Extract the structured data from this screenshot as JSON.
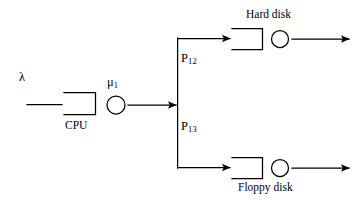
{
  "diagram": {
    "type": "queueing-network",
    "title": "",
    "canvas": {
      "width": 361,
      "height": 208,
      "background": "#ffffff"
    },
    "stroke_color": "#000000",
    "labels": {
      "arrival_rate": "λ",
      "cpu_service_rate": "μ",
      "cpu_service_rate_sub": "1",
      "cpu_station": "CPU",
      "branch_prob_hard": "P",
      "branch_prob_hard_sub": "12",
      "branch_prob_floppy": "P",
      "branch_prob_floppy_sub": "13",
      "hard_disk_station": "Hard disk",
      "floppy_disk_station": "Floppy disk"
    },
    "nodes": [
      {
        "id": "cpu",
        "name": "CPU",
        "queue_box": {
          "x": 64,
          "y": 92,
          "width": 32,
          "height": 23
        },
        "server_circle": {
          "cx": 116,
          "cy": 105,
          "r": 9
        }
      },
      {
        "id": "hard-disk",
        "name": "Hard disk",
        "queue_box": {
          "x": 232,
          "y": 28,
          "width": 31,
          "height": 22
        },
        "server_circle": {
          "cx": 280,
          "cy": 39,
          "r": 8.5
        }
      },
      {
        "id": "floppy-disk",
        "name": "Floppy disk",
        "queue_box": {
          "x": 232,
          "y": 157,
          "width": 31,
          "height": 22
        },
        "server_circle": {
          "cx": 280,
          "cy": 168,
          "r": 8.5
        }
      }
    ],
    "edges": [
      {
        "id": "arrival",
        "from": "external",
        "to": "cpu",
        "label": "λ",
        "arrowhead": false
      },
      {
        "id": "cpu-to-split",
        "from": "cpu",
        "to": "split-point",
        "arrowhead": true
      },
      {
        "id": "split-to-hard",
        "from": "split-point",
        "to": "hard-disk",
        "label": "P12",
        "arrowhead": true
      },
      {
        "id": "split-to-floppy",
        "from": "split-point",
        "to": "floppy-disk",
        "label": "P13",
        "arrowhead": true
      },
      {
        "id": "hard-departure",
        "from": "hard-disk",
        "to": "external",
        "arrowhead": true
      },
      {
        "id": "floppy-departure",
        "from": "floppy-disk",
        "to": "external",
        "arrowhead": true
      }
    ],
    "split_point": {
      "x": 178,
      "y": 105,
      "top_y": 38,
      "bottom_y": 168
    }
  }
}
